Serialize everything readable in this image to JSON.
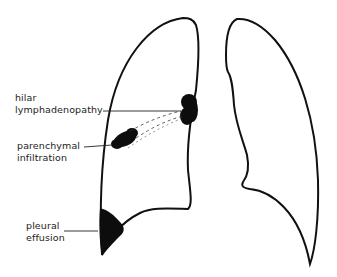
{
  "colors": {
    "outline": "#111111",
    "lesion": "#0d0d0d",
    "text": "#222222",
    "background": "#ffffff"
  },
  "labels": [
    {
      "id": "hilar",
      "lines": [
        "hilar",
        "lymphadenopathy"
      ]
    },
    {
      "id": "parenchymal",
      "lines": [
        "parenchymal",
        "infiltration"
      ]
    },
    {
      "id": "pleural",
      "lines": [
        "pleural",
        "effusion"
      ]
    }
  ]
}
